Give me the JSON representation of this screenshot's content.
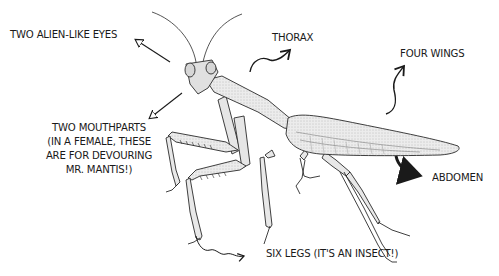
{
  "diagram": {
    "labels": {
      "eyes": "TWO ALIEN-LIKE EYES",
      "thorax": "THORAX",
      "wings": "FOUR WINGS",
      "mouthparts": [
        "TWO MOUTHPARTS",
        "(IN A FEMALE, THESE",
        "ARE FOR DEVOURING",
        "MR. MANTIS!)"
      ],
      "abdomen": "ABDOMEN",
      "legs": "SIX LEGS (IT'S AN INSECT!)"
    },
    "colors": {
      "ink": "#1a1a1a",
      "body_fill": "#e6e6e6",
      "wing_fill": "#dcdcdc",
      "background": "#ffffff"
    }
  }
}
